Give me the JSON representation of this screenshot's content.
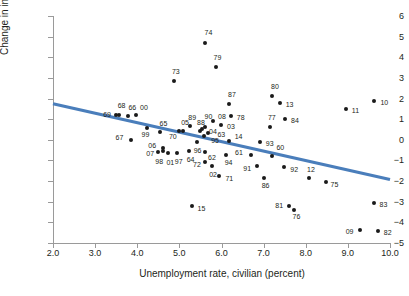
{
  "chart_data": {
    "type": "scatter",
    "title": "",
    "xlabel": "Unemployment rate, civilian (percent)",
    "ylabel": "Change in inflation (percent)",
    "xlim": [
      2.0,
      10.0
    ],
    "ylim": [
      -5,
      6
    ],
    "xticks": [
      "2.0",
      "3.0",
      "4.0",
      "5.0",
      "6.0",
      "7.0",
      "8.0",
      "9.0",
      "10.0"
    ],
    "yticks": [
      "6",
      "5",
      "4",
      "3",
      "2",
      "1",
      "0",
      "-1",
      "-2",
      "-3",
      "-4",
      "-5"
    ],
    "grid": false,
    "legend": null,
    "point_color": "#1a1a1a",
    "trendline": {
      "color": "#4a7ebb",
      "x0": 2.0,
      "y0": 1.75,
      "x1": 10.0,
      "y1": -1.92
    },
    "points": [
      {
        "label": "60",
        "x": 7.21,
        "y": -0.8,
        "lx": 4,
        "ly": -9
      },
      {
        "label": "61",
        "x": 6.7,
        "y": -0.72,
        "lx": -16,
        "ly": -3
      },
      {
        "label": "62",
        "x": 5.61,
        "y": -0.6,
        "lx": 3,
        "ly": 5
      },
      {
        "label": "63",
        "x": 5.69,
        "y": 0.34,
        "lx": 9,
        "ly": 1
      },
      {
        "label": "64",
        "x": 5.22,
        "y": -0.52,
        "lx": -2,
        "ly": 8
      },
      {
        "label": "65",
        "x": 4.53,
        "y": 0.37,
        "lx": 0,
        "ly": -9
      },
      {
        "label": "66",
        "x": 3.79,
        "y": 1.17,
        "lx": 0,
        "ly": -9
      },
      {
        "label": "67",
        "x": 3.84,
        "y": 0.0,
        "lx": -15,
        "ly": -3
      },
      {
        "label": "68",
        "x": 3.56,
        "y": 1.22,
        "lx": -1,
        "ly": -10
      },
      {
        "label": "69",
        "x": 3.5,
        "y": 1.18,
        "lx": -13,
        "ly": -1
      },
      {
        "label": "70",
        "x": 4.99,
        "y": 0.43,
        "lx": -10,
        "ly": 5
      },
      {
        "label": "71",
        "x": 5.95,
        "y": -1.73,
        "lx": 6,
        "ly": 2
      },
      {
        "label": "72",
        "x": 5.61,
        "y": -1.06,
        "lx": -12,
        "ly": 2
      },
      {
        "label": "73",
        "x": 4.87,
        "y": 2.85,
        "lx": -2,
        "ly": -10
      },
      {
        "label": "74",
        "x": 5.62,
        "y": 4.7,
        "lx": -1,
        "ly": -11
      },
      {
        "label": "75",
        "x": 8.47,
        "y": -2.05,
        "lx": 5,
        "ly": 2
      },
      {
        "label": "76",
        "x": 7.71,
        "y": -3.4,
        "lx": -1,
        "ly": 6
      },
      {
        "label": "77",
        "x": 7.15,
        "y": 0.6,
        "lx": -2,
        "ly": -10
      },
      {
        "label": "78",
        "x": 6.22,
        "y": 1.13,
        "lx": 6,
        "ly": 1
      },
      {
        "label": "79",
        "x": 5.86,
        "y": 3.52,
        "lx": -2,
        "ly": -10
      },
      {
        "label": "80",
        "x": 7.2,
        "y": 2.1,
        "lx": -1,
        "ly": -10
      },
      {
        "label": "81",
        "x": 7.61,
        "y": -3.2,
        "lx": -14,
        "ly": -1
      },
      {
        "label": "82",
        "x": 9.71,
        "y": -4.44,
        "lx": 6,
        "ly": 1
      },
      {
        "label": "83",
        "x": 9.61,
        "y": -3.08,
        "lx": 6,
        "ly": 1
      },
      {
        "label": "84",
        "x": 7.51,
        "y": 1.03,
        "lx": 6,
        "ly": 1
      },
      {
        "label": "86",
        "x": 7.0,
        "y": -1.87,
        "lx": -2,
        "ly": 7
      },
      {
        "label": "87",
        "x": 6.18,
        "y": 1.72,
        "lx": -1,
        "ly": -10
      },
      {
        "label": "88",
        "x": 5.49,
        "y": 0.45,
        "lx": -3,
        "ly": -9
      },
      {
        "label": "89",
        "x": 5.26,
        "y": 0.66,
        "lx": -2,
        "ly": -9
      },
      {
        "label": "90",
        "x": 5.62,
        "y": 0.63,
        "lx": -1,
        "ly": -11
      },
      {
        "label": "91",
        "x": 6.85,
        "y": -1.28,
        "lx": -14,
        "ly": 2
      },
      {
        "label": "92",
        "x": 7.49,
        "y": -1.3,
        "lx": 6,
        "ly": 2
      },
      {
        "label": "93",
        "x": 6.91,
        "y": -0.1,
        "lx": 6,
        "ly": 1
      },
      {
        "label": "94",
        "x": 6.1,
        "y": -0.72,
        "lx": -1,
        "ly": 7
      },
      {
        "label": "95",
        "x": 5.59,
        "y": 0.17,
        "lx": 7,
        "ly": 4
      },
      {
        "label": "96",
        "x": 5.41,
        "y": -0.11,
        "lx": -3,
        "ly": 8
      },
      {
        "label": "97",
        "x": 4.94,
        "y": -0.65,
        "lx": -2,
        "ly": 8
      },
      {
        "label": "98",
        "x": 4.5,
        "y": -0.57,
        "lx": -3,
        "ly": 9
      },
      {
        "label": "99",
        "x": 4.22,
        "y": 0.57,
        "lx": -5,
        "ly": 6
      },
      {
        "label": "00",
        "x": 3.97,
        "y": 1.2,
        "lx": 4,
        "ly": -8
      },
      {
        "label": "01",
        "x": 4.74,
        "y": -0.63,
        "lx": -2,
        "ly": 9
      },
      {
        "label": "02",
        "x": 5.78,
        "y": -1.26,
        "lx": -3,
        "ly": 8
      },
      {
        "label": "03",
        "x": 5.99,
        "y": 0.7,
        "lx": 6,
        "ly": 1
      },
      {
        "label": "04",
        "x": 5.54,
        "y": 0.52,
        "lx": 7,
        "ly": 2
      },
      {
        "label": "05",
        "x": 5.09,
        "y": 0.44,
        "lx": -2,
        "ly": -9
      },
      {
        "label": "06",
        "x": 4.62,
        "y": -0.4,
        "lx": -15,
        "ly": -3
      },
      {
        "label": "07",
        "x": 4.62,
        "y": -0.52,
        "lx": -17,
        "ly": 2
      },
      {
        "label": "08",
        "x": 5.8,
        "y": 0.93,
        "lx": 5,
        "ly": -5
      },
      {
        "label": "09",
        "x": 9.28,
        "y": -4.35,
        "lx": -14,
        "ly": 1
      },
      {
        "label": "10",
        "x": 9.63,
        "y": 1.87,
        "lx": 6,
        "ly": 1
      },
      {
        "label": "11",
        "x": 8.95,
        "y": 1.47,
        "lx": 6,
        "ly": 1
      },
      {
        "label": "12",
        "x": 8.08,
        "y": -1.84,
        "lx": -2,
        "ly": -9
      },
      {
        "label": "13",
        "x": 7.38,
        "y": 1.8,
        "lx": 6,
        "ly": 1
      },
      {
        "label": "14",
        "x": 6.17,
        "y": -0.08,
        "lx": 6,
        "ly": -5
      },
      {
        "label": "15",
        "x": 5.29,
        "y": -3.19,
        "lx": 6,
        "ly": 2
      }
    ]
  }
}
